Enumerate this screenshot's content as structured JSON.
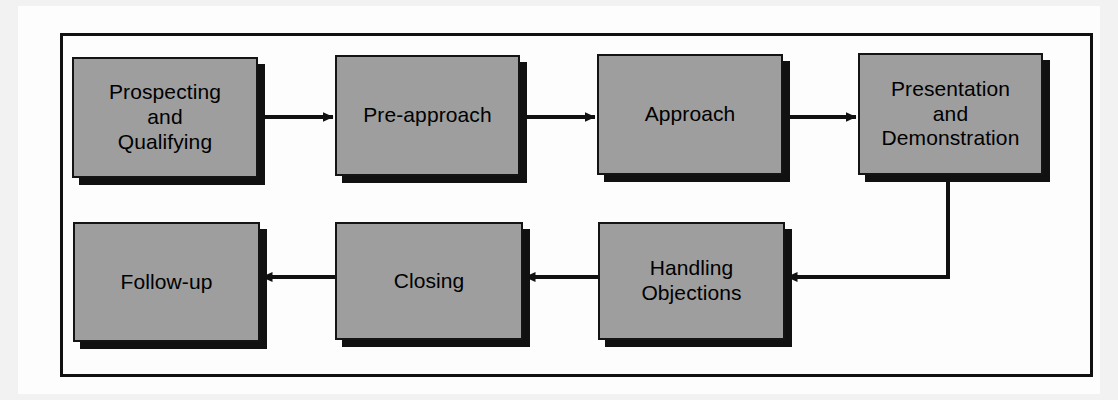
{
  "diagram": {
    "colors": {
      "node_fill": "#9e9e9e",
      "node_border": "#141414",
      "shadow": "#111111",
      "edge": "#111111",
      "frame": "#111111",
      "page_background": "#fdfdfd",
      "outer_background": "#f2f2f2"
    },
    "nodes": [
      {
        "id": "prospecting",
        "label": "Prospecting\nand\nQualifying",
        "x": 72,
        "y": 57,
        "w": 186,
        "h": 121
      },
      {
        "id": "pre_approach",
        "label": "Pre-approach",
        "x": 335,
        "y": 55,
        "w": 185,
        "h": 121
      },
      {
        "id": "approach",
        "label": "Approach",
        "x": 597,
        "y": 54,
        "w": 186,
        "h": 121
      },
      {
        "id": "presentation",
        "label": "Presentation\nand\nDemonstration",
        "x": 858,
        "y": 53,
        "w": 185,
        "h": 122
      },
      {
        "id": "handling",
        "label": "Handling\nObjections",
        "x": 598,
        "y": 222,
        "w": 187,
        "h": 118
      },
      {
        "id": "closing",
        "label": "Closing",
        "x": 335,
        "y": 222,
        "w": 188,
        "h": 118
      },
      {
        "id": "follow_up",
        "label": "Follow-up",
        "x": 73,
        "y": 222,
        "w": 187,
        "h": 120
      }
    ],
    "edges": [
      {
        "id": "e1",
        "from": "prospecting",
        "to": "pre_approach",
        "direction": "right"
      },
      {
        "id": "e2",
        "from": "pre_approach",
        "to": "approach",
        "direction": "right"
      },
      {
        "id": "e3",
        "from": "approach",
        "to": "presentation",
        "direction": "right"
      },
      {
        "id": "e4",
        "from": "presentation",
        "to": "handling",
        "direction": "elbow-down-left"
      },
      {
        "id": "e5",
        "from": "handling",
        "to": "closing",
        "direction": "left"
      },
      {
        "id": "e6",
        "from": "closing",
        "to": "follow_up",
        "direction": "left"
      }
    ]
  }
}
